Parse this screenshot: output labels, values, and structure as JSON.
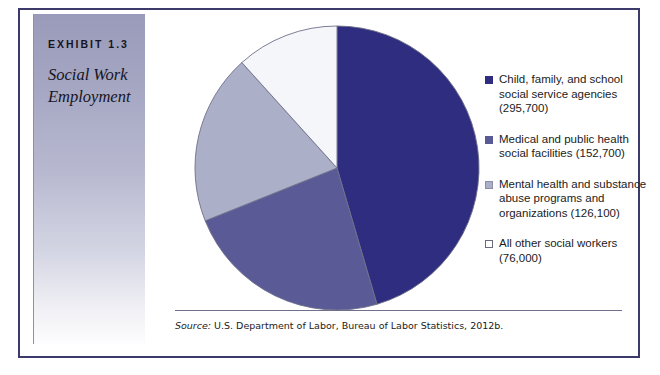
{
  "exhibit": {
    "number": "EXHIBIT 1.3",
    "title": "Social Work\nEmployment"
  },
  "source": {
    "label": "Source:",
    "text": " U.S. Department of Labor, Bureau of Labor Statistics, 2012b."
  },
  "colors": {
    "slice_1": "#2E2D7F",
    "slice_2": "#5A5A96",
    "slice_3": "#ACAFC8",
    "slice_4": "#F4F6FA",
    "slice_outline": "#6f6f8a",
    "frame": "#3b3a6b",
    "sidebar_top": "#9a9bba"
  },
  "legend": [
    {
      "label": "Child, family, and school\nsocial service agencies\n(295,700)",
      "swatch": "#2E2D7F",
      "swatch_border": "#2E2D7F"
    },
    {
      "label": "Medical and public health\nsocial facilities (152,700)",
      "swatch": "#5A5A96",
      "swatch_border": "#5A5A96"
    },
    {
      "label": "Mental health and\nsubstance abuse\nprograms and\norganizations (126,100)",
      "swatch": "#ACAFC8",
      "swatch_border": "#8b8ea9"
    },
    {
      "label": "All other social workers\n(76,000)",
      "swatch": "#FFFFFF",
      "swatch_border": "#6b6b80"
    }
  ],
  "chart_data": {
    "type": "pie",
    "title": "Social Work Employment",
    "xlabel": "",
    "ylabel": "",
    "legend_position": "right",
    "grid": false,
    "total": 650500,
    "start_angle_deg": 0,
    "direction": "clockwise",
    "categories": [
      "Child, family, and school social service agencies",
      "Medical and public health social facilities",
      "Mental health and substance abuse programs and organizations",
      "All other social workers"
    ],
    "values": [
      295700,
      152700,
      126100,
      76000
    ],
    "value_labels": [
      "(295,700)",
      "(152,700)",
      "(126,100)",
      "(76,000)"
    ],
    "percents": [
      45.5,
      23.5,
      19.4,
      11.7
    ],
    "colors": [
      "#2E2D7F",
      "#5A5A96",
      "#ACAFC8",
      "#F4F6FA"
    ]
  }
}
